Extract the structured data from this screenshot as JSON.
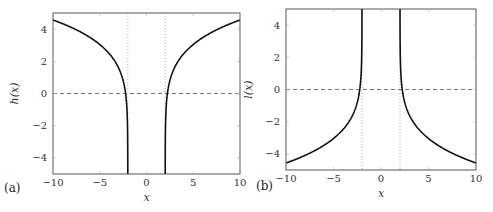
{
  "chart_data": [
    {
      "type": "line",
      "panel_label": "(a)",
      "title": "",
      "xlabel": "x",
      "ylabel": "h(x)",
      "xlim": [
        -10,
        10
      ],
      "ylim": [
        -5,
        5
      ],
      "xticks": [
        "−10",
        "−5",
        "0",
        "5",
        "10"
      ],
      "yticks": [
        "−4",
        "−2",
        "0",
        "2",
        "4"
      ],
      "grid": false,
      "function": "h(x) = ln(x^2 - 4)",
      "asymptotes_x": [
        -2,
        2
      ],
      "reference_y": 0,
      "series": [
        {
          "name": "h(x) left branch",
          "x": [
            -10,
            -8,
            -6,
            -4,
            -3,
            -2.5,
            -2.236,
            -2.1,
            -2.02
          ],
          "y": [
            4.56,
            4.09,
            3.47,
            2.48,
            1.61,
            0.81,
            0.0,
            -0.9,
            -2.5
          ]
        },
        {
          "name": "h(x) right branch",
          "x": [
            2.02,
            2.1,
            2.236,
            2.5,
            3,
            4,
            6,
            8,
            10
          ],
          "y": [
            -2.5,
            -0.9,
            0.0,
            0.81,
            1.61,
            2.48,
            3.47,
            4.09,
            4.56
          ]
        }
      ]
    },
    {
      "type": "line",
      "panel_label": "(b)",
      "title": "",
      "xlabel": "x",
      "ylabel": "l(x)",
      "xlim": [
        -10,
        10
      ],
      "ylim": [
        -5,
        5
      ],
      "xticks": [
        "−10",
        "−5",
        "0",
        "5",
        "10"
      ],
      "yticks": [
        "−4",
        "−2",
        "0",
        "2",
        "4"
      ],
      "grid": false,
      "function": "l(x) = -ln(x^2 - 4)",
      "asymptotes_x": [
        -2,
        2
      ],
      "reference_y": 0,
      "series": [
        {
          "name": "l(x) left branch",
          "x": [
            -10,
            -8,
            -6,
            -4,
            -3,
            -2.5,
            -2.236,
            -2.1,
            -2.02
          ],
          "y": [
            -4.56,
            -4.09,
            -3.47,
            -2.48,
            -1.61,
            -0.81,
            0.0,
            0.9,
            2.5
          ]
        },
        {
          "name": "l(x) right branch",
          "x": [
            2.02,
            2.1,
            2.236,
            2.5,
            3,
            4,
            6,
            8,
            10
          ],
          "y": [
            2.5,
            0.9,
            0.0,
            -0.81,
            -1.61,
            -2.48,
            -3.47,
            -4.09,
            -4.56
          ]
        }
      ]
    }
  ]
}
